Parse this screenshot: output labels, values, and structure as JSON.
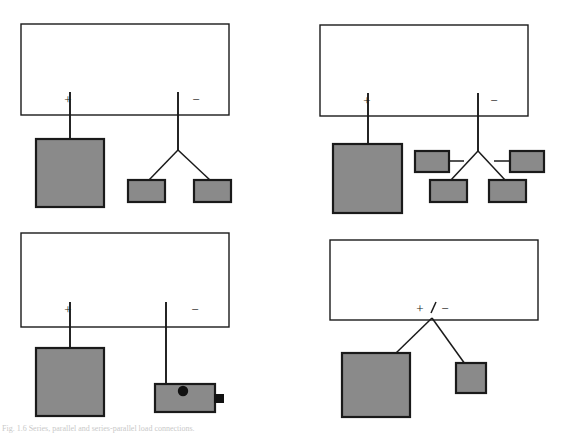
{
  "figure": {
    "caption": "Fig. 1.6  Series, parallel and series-parallel load connections.",
    "colors": {
      "load_fill": "#8a8a8a",
      "outline": "#1a1a1a",
      "panel_fill": "#ffffff",
      "marker": "#111111"
    }
  },
  "panels": [
    {
      "id": "top-left",
      "name": "series-parallel-two-branch",
      "source": {
        "label": "source-rectangle",
        "x": 21,
        "y": 24,
        "w": 208,
        "h": 91
      },
      "terminals": [
        {
          "symbol": "+",
          "x": 68,
          "y": 101
        },
        {
          "symbol": "−",
          "x": 196,
          "y": 101
        }
      ],
      "loads": [
        {
          "name": "large-load",
          "x": 36,
          "y": 139,
          "w": 68,
          "h": 68
        },
        {
          "name": "small-load-left",
          "x": 128,
          "y": 180,
          "w": 37,
          "h": 22
        },
        {
          "name": "small-load-right",
          "x": 194,
          "y": 180,
          "w": 37,
          "h": 22
        }
      ]
    },
    {
      "id": "top-right",
      "name": "series-parallel-four-branch",
      "source": {
        "label": "source-rectangle",
        "x": 320,
        "y": 25,
        "w": 208,
        "h": 91
      },
      "terminals": [
        {
          "symbol": "+",
          "x": 367,
          "y": 102
        },
        {
          "symbol": "−",
          "x": 494,
          "y": 102
        }
      ],
      "loads": [
        {
          "name": "large-load",
          "x": 333,
          "y": 144,
          "w": 69,
          "h": 69
        },
        {
          "name": "small-load-upper-left",
          "x": 415,
          "y": 151,
          "w": 34,
          "h": 21
        },
        {
          "name": "small-load-upper-right",
          "x": 510,
          "y": 151,
          "w": 34,
          "h": 21
        },
        {
          "name": "small-load-lower-left",
          "x": 430,
          "y": 180,
          "w": 37,
          "h": 22
        },
        {
          "name": "small-load-lower-right",
          "x": 489,
          "y": 180,
          "w": 37,
          "h": 22
        }
      ]
    },
    {
      "id": "bottom-left",
      "name": "load-with-switch-and-terminal",
      "source": {
        "label": "source-rectangle",
        "x": 21,
        "y": 233,
        "w": 208,
        "h": 94
      },
      "terminals": [
        {
          "symbol": "+",
          "x": 68,
          "y": 311
        },
        {
          "symbol": "−",
          "x": 195,
          "y": 311
        }
      ],
      "loads": [
        {
          "name": "large-load",
          "x": 36,
          "y": 348,
          "w": 68,
          "h": 68
        },
        {
          "name": "switch-body-load",
          "x": 155,
          "y": 384,
          "w": 60,
          "h": 28
        }
      ],
      "markers": [
        {
          "name": "switch-knob-dot",
          "cx": 183,
          "cy": 391,
          "r": 5
        },
        {
          "name": "terminal-tab",
          "x": 215,
          "y": 394,
          "w": 9,
          "h": 9
        }
      ]
    },
    {
      "id": "bottom-right",
      "name": "parallel-two-load-single-terminal",
      "source": {
        "label": "source-rectangle",
        "x": 330,
        "y": 240,
        "w": 208,
        "h": 80
      },
      "terminals": [
        {
          "symbol": "+",
          "x": 421,
          "y": 310
        },
        {
          "symbol": "−",
          "x": 444,
          "y": 310
        }
      ],
      "loads": [
        {
          "name": "large-load",
          "x": 342,
          "y": 353,
          "w": 68,
          "h": 64
        },
        {
          "name": "small-load",
          "x": 456,
          "y": 363,
          "w": 30,
          "h": 30
        }
      ]
    }
  ]
}
